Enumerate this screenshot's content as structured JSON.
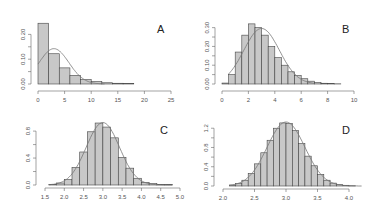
{
  "chart_data": [
    {
      "type": "bar",
      "label": "A",
      "title": "",
      "xlabel": "",
      "ylabel": "",
      "xlim": [
        0,
        25
      ],
      "ylim": [
        0,
        0.25
      ],
      "xticks": [
        "0",
        "5",
        "10",
        "15",
        "20",
        "25"
      ],
      "yticks": [
        "0.00",
        "0.10",
        "0.20"
      ],
      "bin_width": 2,
      "bin_starts": [
        0,
        2,
        4,
        6,
        8,
        10,
        12,
        14,
        16
      ],
      "values": [
        0.245,
        0.122,
        0.065,
        0.035,
        0.018,
        0.01,
        0.005,
        0.003,
        0.002
      ],
      "overlay": "normal density curve, mean≈3, sd≈2.8"
    },
    {
      "type": "bar",
      "label": "B",
      "title": "",
      "xlabel": "",
      "ylabel": "",
      "xlim": [
        0,
        10
      ],
      "ylim": [
        0,
        0.33
      ],
      "xticks": [
        "0",
        "2",
        "4",
        "6",
        "8",
        "10"
      ],
      "yticks": [
        "0.00",
        "0.10",
        "0.20",
        "0.30"
      ],
      "bin_width": 0.5,
      "bin_starts": [
        0,
        0.5,
        1,
        1.5,
        2,
        2.5,
        3,
        3.5,
        4,
        4.5,
        5,
        5.5,
        6,
        6.5,
        7,
        7.5,
        8,
        8.5
      ],
      "values": [
        0.005,
        0.05,
        0.17,
        0.26,
        0.32,
        0.3,
        0.26,
        0.2,
        0.14,
        0.1,
        0.065,
        0.045,
        0.028,
        0.015,
        0.008,
        0.004,
        0.002,
        0.001
      ],
      "overlay": "normal density curve, mean≈3, sd≈1.35"
    },
    {
      "type": "bar",
      "label": "C",
      "title": "",
      "xlabel": "",
      "ylabel": "",
      "xlim": [
        1.5,
        5.0
      ],
      "ylim": [
        0,
        0.95
      ],
      "xticks": [
        "1.5",
        "2.0",
        "2.5",
        "3.0",
        "3.5",
        "4.0",
        "4.5",
        "5.0"
      ],
      "yticks": [
        "0.0",
        "0.4",
        "0.8"
      ],
      "bin_width": 0.2,
      "bin_starts": [
        1.6,
        1.8,
        2.0,
        2.2,
        2.4,
        2.6,
        2.8,
        3.0,
        3.2,
        3.4,
        3.6,
        3.8,
        4.0,
        4.2,
        4.4,
        4.6
      ],
      "values": [
        0.01,
        0.03,
        0.08,
        0.26,
        0.49,
        0.79,
        0.92,
        0.86,
        0.7,
        0.41,
        0.25,
        0.1,
        0.04,
        0.02,
        0.01,
        0.005
      ],
      "overlay": "normal density curve, mean≈3, sd≈0.43"
    },
    {
      "type": "bar",
      "label": "D",
      "title": "",
      "xlabel": "",
      "ylabel": "",
      "xlim": [
        2.0,
        4.2
      ],
      "ylim": [
        0,
        1.35
      ],
      "xticks": [
        "2.0",
        "2.5",
        "3.0",
        "3.5",
        "4.0"
      ],
      "yticks": [
        "0.0",
        "0.4",
        "0.8",
        "1.2"
      ],
      "bin_width": 0.1,
      "bin_starts": [
        2.1,
        2.2,
        2.3,
        2.4,
        2.5,
        2.6,
        2.7,
        2.8,
        2.9,
        3.0,
        3.1,
        3.2,
        3.3,
        3.4,
        3.5,
        3.6,
        3.7,
        3.8,
        3.9,
        4.0
      ],
      "values": [
        0.02,
        0.05,
        0.12,
        0.26,
        0.46,
        0.69,
        0.95,
        1.2,
        1.31,
        1.3,
        1.15,
        0.88,
        0.62,
        0.42,
        0.24,
        0.12,
        0.06,
        0.03,
        0.015,
        0.005
      ],
      "overlay": "normal density curve, mean≈3, sd≈0.3"
    }
  ],
  "panels": {
    "A": {
      "label": "A"
    },
    "B": {
      "label": "B"
    },
    "C": {
      "label": "C"
    },
    "D": {
      "label": "D"
    }
  },
  "style": {
    "bar_fill": "#c8c8c8",
    "bar_stroke": "#444444",
    "curve_color": "#777777",
    "axis_color": "#666666"
  }
}
